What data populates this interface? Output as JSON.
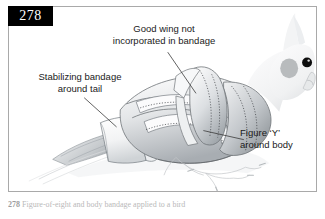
{
  "figure": {
    "page_number": "278",
    "caption_number": "278",
    "caption_text": "Figure-of-eight and body bandage applied to a bird"
  },
  "annotations": [
    {
      "id": "good-wing",
      "name": "annotation-good-wing",
      "line1": "Good wing not",
      "line2": "incorporated in bandage"
    },
    {
      "id": "stabilizing-bandage",
      "name": "annotation-stabilizing-bandage",
      "line1": "Stabilizing bandage",
      "line2": "around tail"
    },
    {
      "id": "figure-y",
      "name": "annotation-figure-y",
      "line1": "Figure ‘Y’",
      "line2": "around body"
    }
  ],
  "illustration": {
    "subject": "cockatiel-with-body-bandage",
    "colors": {
      "outline": "#6f7478",
      "bandage_light": "#fdfdfd",
      "bandage_shade": "#c9ccd0",
      "body_shade": "#b7bcc1",
      "feather_grey": "#9aa0a5",
      "head_light": "#f2f3f4",
      "cheek_patch": "#b8bbbd",
      "eye": "#0d0d0d",
      "frame_border": "#a9a9a9",
      "badge_background": "#000000",
      "badge_text": "#ffffff",
      "leader_line": "#3a3a3a"
    }
  }
}
